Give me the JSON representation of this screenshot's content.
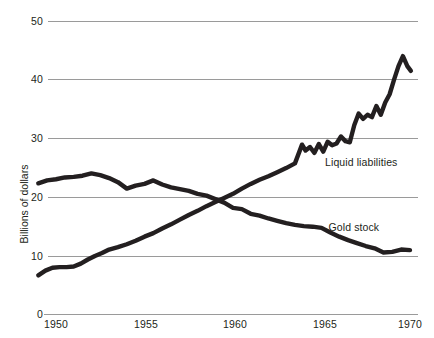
{
  "chart_data": {
    "type": "line",
    "title": "",
    "xlabel": "",
    "ylabel": "Billions of dollars",
    "xlim": [
      1949,
      1970.3
    ],
    "ylim": [
      0,
      50
    ],
    "grid": true,
    "legend_position": "inline-annotation",
    "ytick_labels": [
      "50",
      "40",
      "30",
      "20",
      "10",
      "0"
    ],
    "ytick_values": [
      50,
      40,
      30,
      20,
      10,
      0
    ],
    "xtick_labels": [
      "1950",
      "1955",
      "1960",
      "1965",
      "1970"
    ],
    "xtick_values": [
      1950,
      1955,
      1960,
      1965,
      1970
    ],
    "series": [
      {
        "name": "Gold stock",
        "label": "Gold stock",
        "color": "#231f20",
        "x": [
          1949.0,
          1949.5,
          1950.0,
          1950.5,
          1951.0,
          1951.5,
          1952.0,
          1952.5,
          1953.0,
          1953.5,
          1954.0,
          1954.5,
          1955.0,
          1955.5,
          1956.0,
          1956.5,
          1957.0,
          1957.5,
          1958.0,
          1958.5,
          1959.0,
          1959.5,
          1960.0,
          1960.5,
          1961.0,
          1961.5,
          1962.0,
          1962.5,
          1963.0,
          1963.5,
          1964.0,
          1964.5,
          1965.0,
          1965.5,
          1966.0,
          1966.5,
          1967.0,
          1967.5,
          1968.0,
          1968.5,
          1969.0,
          1969.5,
          1970.0
        ],
        "y": [
          22.3,
          22.8,
          23.0,
          23.3,
          23.4,
          23.6,
          24.0,
          23.7,
          23.2,
          22.5,
          21.4,
          21.9,
          22.2,
          22.8,
          22.1,
          21.6,
          21.3,
          21.0,
          20.5,
          20.2,
          19.6,
          19.0,
          18.1,
          17.9,
          17.1,
          16.8,
          16.3,
          15.9,
          15.5,
          15.2,
          15.0,
          14.9,
          14.7,
          13.9,
          13.2,
          12.6,
          12.1,
          11.6,
          11.2,
          10.5,
          10.6,
          11.0,
          10.9
        ],
        "label_x": 1965.4,
        "label_y": 14.8
      },
      {
        "name": "Liquid liabilities",
        "label": "Liquid liabilities",
        "color": "#231f20",
        "x": [
          1949.0,
          1949.4,
          1949.8,
          1950.2,
          1950.6,
          1951.0,
          1951.4,
          1951.8,
          1952.2,
          1952.6,
          1953.0,
          1953.5,
          1954.0,
          1954.5,
          1955.0,
          1955.5,
          1956.0,
          1956.5,
          1957.0,
          1957.5,
          1958.0,
          1958.5,
          1959.0,
          1959.5,
          1960.0,
          1960.5,
          1961.0,
          1961.5,
          1962.0,
          1962.5,
          1963.0,
          1963.5,
          1963.9,
          1964.1,
          1964.35,
          1964.6,
          1964.85,
          1965.1,
          1965.35,
          1965.6,
          1965.85,
          1966.1,
          1966.35,
          1966.6,
          1966.85,
          1967.1,
          1967.35,
          1967.6,
          1967.85,
          1968.1,
          1968.35,
          1968.6,
          1968.85,
          1969.1,
          1969.35,
          1969.6,
          1969.85,
          1970.05
        ],
        "y": [
          6.6,
          7.4,
          7.9,
          8.0,
          8.0,
          8.1,
          8.6,
          9.3,
          9.9,
          10.4,
          11.0,
          11.4,
          11.9,
          12.5,
          13.2,
          13.8,
          14.6,
          15.3,
          16.1,
          16.9,
          17.6,
          18.4,
          19.1,
          19.8,
          20.5,
          21.4,
          22.2,
          22.9,
          23.5,
          24.2,
          24.9,
          25.7,
          28.9,
          27.9,
          28.5,
          27.5,
          29.0,
          27.7,
          29.4,
          28.8,
          29.1,
          30.3,
          29.5,
          29.3,
          32.2,
          34.2,
          33.3,
          34.0,
          33.6,
          35.5,
          34.0,
          36.1,
          37.5,
          40.0,
          42.3,
          44.0,
          42.3,
          41.5
        ],
        "label_x": 1965.2,
        "label_y": 25.9
      }
    ]
  },
  "axes_style": {
    "gridline_color": "#9a9a9a",
    "text_color": "#231f20",
    "background": "#ffffff"
  }
}
